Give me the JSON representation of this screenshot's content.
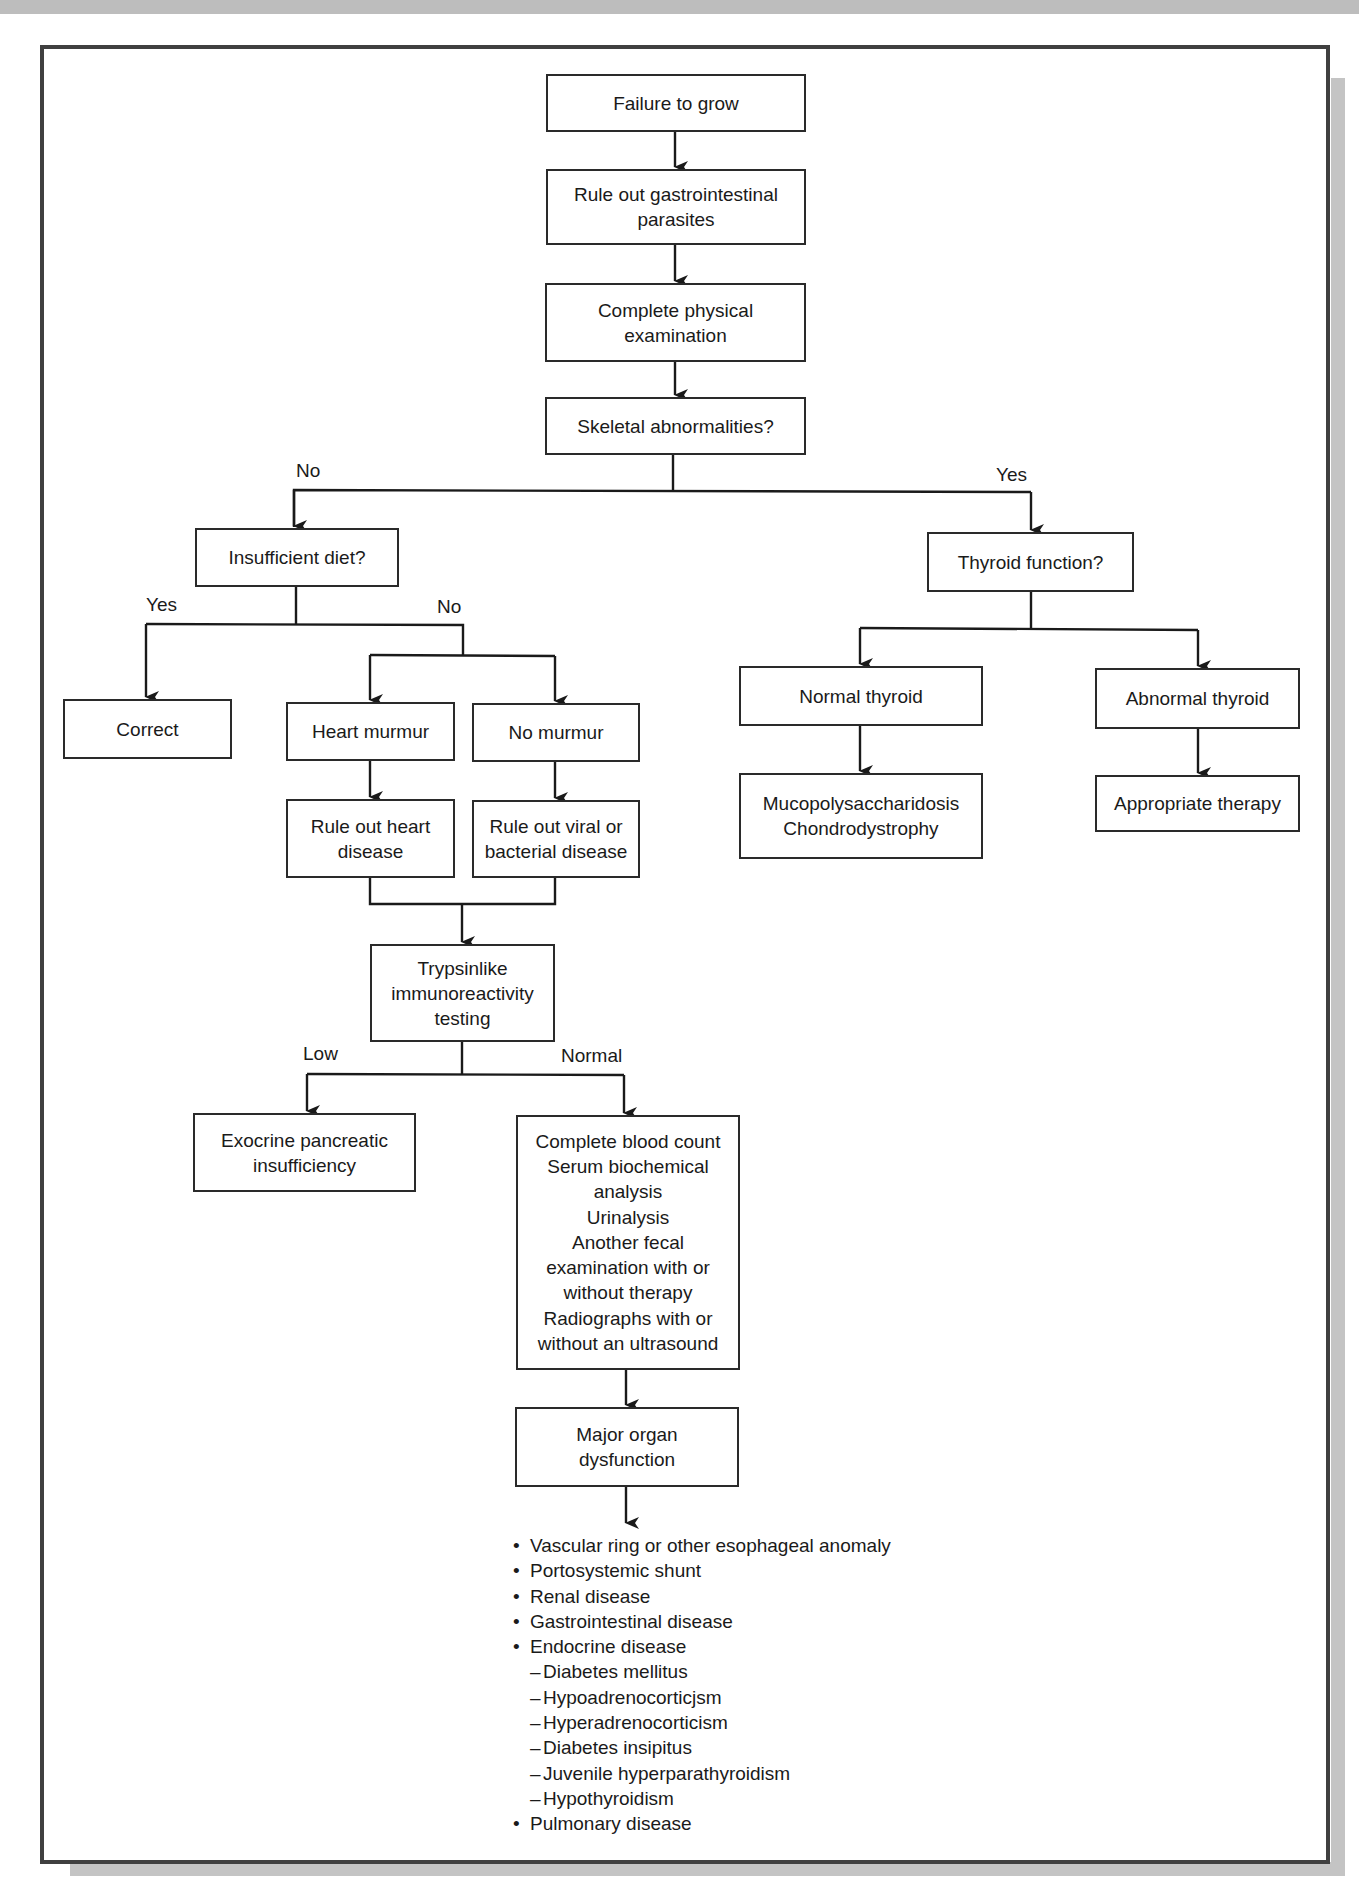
{
  "diagram": {
    "type": "flowchart",
    "nodes": {
      "failure_to_grow": "Failure to grow",
      "rule_out_gi_parasites": "Rule out gastrointestinal\nparasites",
      "physical_exam": "Complete physical\nexamination",
      "skeletal_abnormalities": "Skeletal abnormalities?",
      "insufficient_diet": "Insufficient diet?",
      "correct": "Correct",
      "heart_murmur": "Heart murmur",
      "no_murmur": "No murmur",
      "rule_out_heart_disease": "Rule out heart\ndisease",
      "rule_out_viral_bacterial": "Rule out viral or\nbacterial disease",
      "tli_testing": "Trypsinlike\nimmunoreactivity\ntesting",
      "exocrine_pancreatic_insufficiency": "Exocrine pancreatic\ninsufficiency",
      "further_workup": "Complete blood count\nSerum biochemical\nanalysis\nUrinalysis\nAnother fecal\nexamination with or\nwithout therapy\nRadiographs with or\nwithout an ultrasound",
      "major_organ_dysfunction": "Major organ\ndysfunction",
      "thyroid_function": "Thyroid function?",
      "normal_thyroid": "Normal thyroid",
      "abnormal_thyroid": "Abnormal thyroid",
      "mps_chondrodystrophy": "Mucopolysaccharidosis\nChondrodystrophy",
      "appropriate_therapy": "Appropriate therapy"
    },
    "edge_labels": {
      "skeletal_no": "No",
      "skeletal_yes": "Yes",
      "diet_yes": "Yes",
      "diet_no": "No",
      "tli_low": "Low",
      "tli_normal": "Normal"
    },
    "edges": [
      [
        "failure_to_grow",
        "rule_out_gi_parasites",
        ""
      ],
      [
        "rule_out_gi_parasites",
        "physical_exam",
        ""
      ],
      [
        "physical_exam",
        "skeletal_abnormalities",
        ""
      ],
      [
        "skeletal_abnormalities",
        "insufficient_diet",
        "No"
      ],
      [
        "skeletal_abnormalities",
        "thyroid_function",
        "Yes"
      ],
      [
        "insufficient_diet",
        "correct",
        "Yes"
      ],
      [
        "insufficient_diet",
        "heart_murmur",
        "No"
      ],
      [
        "insufficient_diet",
        "no_murmur",
        "No"
      ],
      [
        "heart_murmur",
        "rule_out_heart_disease",
        ""
      ],
      [
        "no_murmur",
        "rule_out_viral_bacterial",
        ""
      ],
      [
        "rule_out_heart_disease",
        "tli_testing",
        ""
      ],
      [
        "rule_out_viral_bacterial",
        "tli_testing",
        ""
      ],
      [
        "tli_testing",
        "exocrine_pancreatic_insufficiency",
        "Low"
      ],
      [
        "tli_testing",
        "further_workup",
        "Normal"
      ],
      [
        "further_workup",
        "major_organ_dysfunction",
        ""
      ],
      [
        "major_organ_dysfunction",
        "outcome_list",
        ""
      ],
      [
        "thyroid_function",
        "normal_thyroid",
        ""
      ],
      [
        "thyroid_function",
        "abnormal_thyroid",
        ""
      ],
      [
        "normal_thyroid",
        "mps_chondrodystrophy",
        ""
      ],
      [
        "abnormal_thyroid",
        "appropriate_therapy",
        ""
      ]
    ],
    "outcome_list": [
      {
        "level": 1,
        "text": "Vascular ring or other esophageal anomaly"
      },
      {
        "level": 1,
        "text": "Portosystemic shunt"
      },
      {
        "level": 1,
        "text": "Renal disease"
      },
      {
        "level": 1,
        "text": "Gastrointestinal disease"
      },
      {
        "level": 1,
        "text": "Endocrine disease"
      },
      {
        "level": 2,
        "text": "Diabetes mellitus"
      },
      {
        "level": 2,
        "text": "Hypoadrenocorticjsm"
      },
      {
        "level": 2,
        "text": "Hyperadrenocorticism"
      },
      {
        "level": 2,
        "text": "Diabetes insipitus"
      },
      {
        "level": 2,
        "text": "Juvenile hyperparathyroidism"
      },
      {
        "level": 2,
        "text": "Hypothyroidism"
      },
      {
        "level": 1,
        "text": "Pulmonary disease"
      }
    ],
    "sub_item_prefix": "–",
    "colors": {
      "line": "#1a1a1a",
      "box_border": "#2a2a2a",
      "frame_border": "#404040",
      "shadow": "#c4c4c4",
      "background": "#ffffff"
    }
  }
}
